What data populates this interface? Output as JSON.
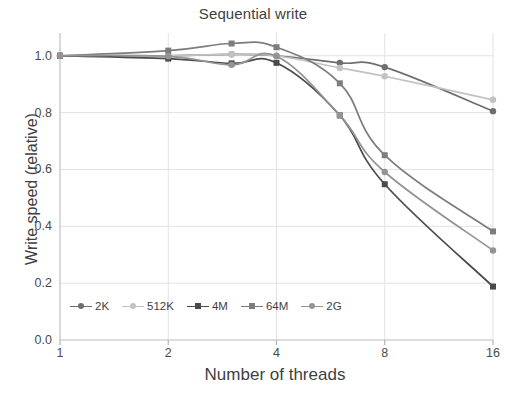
{
  "chart_data": {
    "type": "line",
    "title": "Sequential write",
    "xlabel": "Number of threads",
    "ylabel": "Write speed (relative)",
    "x": [
      1,
      2,
      3,
      4,
      6,
      8,
      16
    ],
    "x_scale": "log2",
    "x_tick_values": [
      1,
      2,
      4,
      8,
      16
    ],
    "x_tick_labels": [
      "1",
      "2",
      "4",
      "8",
      "16"
    ],
    "xlim": [
      1,
      16
    ],
    "ylim": [
      0.0,
      1.08
    ],
    "y_tick_values": [
      0.0,
      0.2,
      0.4,
      0.6,
      0.8,
      1.0
    ],
    "y_tick_labels": [
      "0.0",
      "0.2",
      "0.4",
      "0.6",
      "0.8",
      "1.0"
    ],
    "grid": "horizontal-and-vertical",
    "legend_position": "inside-bottom-left",
    "series": [
      {
        "name": "2K",
        "color": "#6e6e6e",
        "marker": "circle",
        "values": [
          1.0,
          1.0,
          1.005,
          1.0,
          0.975,
          0.96,
          0.805
        ]
      },
      {
        "name": "512K",
        "color": "#c2c2c2",
        "marker": "circle",
        "values": [
          1.0,
          1.0,
          1.005,
          1.0,
          0.957,
          0.928,
          0.845
        ]
      },
      {
        "name": "4M",
        "color": "#4a4a4a",
        "marker": "square",
        "values": [
          1.0,
          0.99,
          0.973,
          0.975,
          0.79,
          0.548,
          0.188
        ]
      },
      {
        "name": "64M",
        "color": "#7d7d7d",
        "marker": "square",
        "values": [
          1.0,
          1.018,
          1.043,
          1.03,
          0.903,
          0.65,
          0.382
        ]
      },
      {
        "name": "2G",
        "color": "#949494",
        "marker": "circle",
        "values": [
          1.0,
          0.998,
          0.968,
          0.998,
          0.79,
          0.591,
          0.315
        ]
      }
    ]
  },
  "axes": {
    "y_labels": [
      "1.0",
      "0.8",
      "0.6",
      "0.4",
      "0.2",
      "0.0"
    ],
    "x_labels": [
      "1",
      "2",
      "4",
      "8",
      "16"
    ]
  },
  "legend": {
    "items": [
      {
        "label": "2K",
        "color": "#6e6e6e"
      },
      {
        "label": "512K",
        "color": "#c2c2c2"
      },
      {
        "label": "4M",
        "color": "#4a4a4a"
      },
      {
        "label": "64M",
        "color": "#7d7d7d"
      },
      {
        "label": "2G",
        "color": "#949494"
      }
    ]
  },
  "style": {
    "grid_color": "#e2e2e2",
    "axis_color": "#d9d9d9",
    "text_color": "#3f3f3f",
    "background": "#ffffff"
  }
}
